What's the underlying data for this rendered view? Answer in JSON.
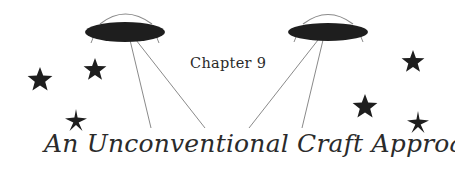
{
  "heading": {
    "chapter_label": "Chapter 9",
    "title": "An Unconventional Craft Approaches"
  },
  "illustration": {
    "ufos": [
      {
        "name": "left-ufo",
        "cx": 125,
        "cy": 32,
        "rx": 40,
        "ry": 10
      },
      {
        "name": "right-ufo",
        "cx": 328,
        "cy": 32,
        "rx": 40,
        "ry": 9
      }
    ],
    "stars": [
      {
        "x": 40,
        "y": 80,
        "r": 13
      },
      {
        "x": 95,
        "y": 70,
        "r": 12
      },
      {
        "x": 76,
        "y": 120,
        "r": 11
      },
      {
        "x": 413,
        "y": 62,
        "r": 12
      },
      {
        "x": 365,
        "y": 107,
        "r": 13
      },
      {
        "x": 418,
        "y": 123,
        "r": 12
      }
    ],
    "colors": {
      "ink": "#1e1e1e",
      "line": "#888888",
      "text": "#2b2b2b"
    }
  }
}
